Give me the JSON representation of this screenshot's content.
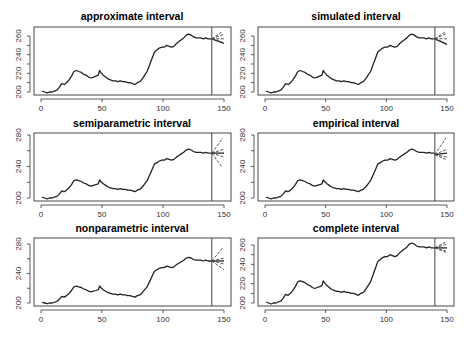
{
  "figure": {
    "layout": "3 rows x 2 columns",
    "line_color": "#222222",
    "forecast_color": "#555555",
    "cutoff_line_color": "#444444"
  },
  "chart_data": [
    {
      "type": "line",
      "title": "approximate interval",
      "xlabel": "",
      "ylabel": "",
      "xlim": [
        0,
        150
      ],
      "ylim": [
        196,
        268
      ],
      "xticks": [
        0,
        50,
        100,
        150
      ],
      "yticks": [
        200,
        210,
        220,
        230,
        240,
        250,
        260
      ],
      "ytick_labels": [
        "200",
        "",
        "220",
        "",
        "240",
        "",
        "260"
      ],
      "cutoff_x": 140,
      "grid": false,
      "forecast": {
        "start": [
          140,
          257
        ],
        "ends": [
          [
            150,
            262
          ],
          [
            150,
            257
          ],
          [
            150,
            252
          ],
          [
            149,
            265
          ],
          [
            148,
            254
          ]
        ]
      }
    },
    {
      "type": "line",
      "title": "simulated interval",
      "xlabel": "",
      "ylabel": "",
      "xlim": [
        0,
        150
      ],
      "ylim": [
        196,
        268
      ],
      "xticks": [
        0,
        50,
        100,
        150
      ],
      "yticks": [
        200,
        210,
        220,
        230,
        240,
        250,
        260
      ],
      "ytick_labels": [
        "200",
        "",
        "220",
        "",
        "240",
        "",
        "260"
      ],
      "cutoff_x": 140,
      "grid": false,
      "forecast": {
        "start": [
          140,
          257
        ],
        "ends": [
          [
            150,
            263
          ],
          [
            150,
            257
          ],
          [
            150,
            251
          ],
          [
            149,
            265
          ],
          [
            148,
            253
          ]
        ]
      }
    },
    {
      "type": "line",
      "title": "semiparametric interval",
      "xlabel": "",
      "ylabel": "",
      "xlim": [
        0,
        150
      ],
      "ylim": [
        196,
        284
      ],
      "xticks": [
        0,
        50,
        100,
        150
      ],
      "yticks": [
        200,
        220,
        240,
        260,
        280
      ],
      "ytick_labels": [
        "200",
        "",
        "240",
        "",
        "280"
      ],
      "cutoff_x": 140,
      "grid": false,
      "forecast": {
        "start": [
          140,
          257
        ],
        "ends": [
          [
            149,
            276
          ],
          [
            150,
            262
          ],
          [
            150,
            257
          ],
          [
            150,
            252
          ],
          [
            148,
            240
          ]
        ]
      }
    },
    {
      "type": "line",
      "title": "empirical interval",
      "xlabel": "",
      "ylabel": "",
      "xlim": [
        0,
        150
      ],
      "ylim": [
        196,
        284
      ],
      "xticks": [
        0,
        50,
        100,
        150
      ],
      "yticks": [
        200,
        220,
        240,
        260,
        280
      ],
      "ytick_labels": [
        "200",
        "",
        "240",
        "",
        "280"
      ],
      "cutoff_x": 140,
      "grid": false,
      "forecast": {
        "start": [
          140,
          255
        ],
        "ends": [
          [
            149,
            276
          ],
          [
            150,
            262
          ],
          [
            150,
            257
          ],
          [
            150,
            252
          ],
          [
            149,
            249
          ]
        ]
      }
    },
    {
      "type": "line",
      "title": "nonparametric interval",
      "xlabel": "",
      "ylabel": "",
      "xlim": [
        0,
        150
      ],
      "ylim": [
        196,
        284
      ],
      "xticks": [
        0,
        50,
        100,
        150
      ],
      "yticks": [
        200,
        220,
        240,
        260,
        280
      ],
      "ytick_labels": [
        "200",
        "",
        "240",
        "",
        "280"
      ],
      "cutoff_x": 140,
      "grid": false,
      "forecast": {
        "start": [
          140,
          257
        ],
        "ends": [
          [
            149,
            275
          ],
          [
            150,
            261
          ],
          [
            150,
            257
          ],
          [
            150,
            253
          ],
          [
            150,
            245
          ]
        ]
      }
    },
    {
      "type": "line",
      "title": "complete interval",
      "xlabel": "",
      "ylabel": "",
      "xlim": [
        0,
        150
      ],
      "ylim": [
        196,
        268
      ],
      "xticks": [
        0,
        50,
        100,
        150
      ],
      "yticks": [
        200,
        210,
        220,
        230,
        240,
        250,
        260
      ],
      "ytick_labels": [
        "200",
        "",
        "220",
        "",
        "240",
        "",
        "260"
      ],
      "cutoff_x": 140,
      "grid": false,
      "forecast": {
        "start": [
          140,
          257
        ],
        "ends": [
          [
            150,
            264
          ],
          [
            150,
            261
          ],
          [
            150,
            257
          ],
          [
            150,
            252
          ],
          [
            149,
            254
          ]
        ]
      }
    }
  ],
  "series": {
    "name": "observed",
    "x": [
      1,
      3,
      5,
      7,
      9,
      11,
      13,
      15,
      17,
      19,
      21,
      23,
      25,
      27,
      29,
      31,
      33,
      35,
      37,
      39,
      41,
      43,
      45,
      47,
      48,
      49,
      51,
      53,
      55,
      57,
      59,
      61,
      63,
      65,
      67,
      69,
      71,
      73,
      75,
      77,
      79,
      81,
      83,
      85,
      87,
      89,
      91,
      93,
      95,
      97,
      99,
      101,
      103,
      105,
      107,
      109,
      111,
      113,
      115,
      117,
      119,
      121,
      123,
      125,
      127,
      129,
      131,
      133,
      135,
      137,
      139,
      140
    ],
    "y": [
      201,
      200,
      199,
      200,
      200,
      201,
      202,
      205,
      209,
      208,
      210,
      213,
      217,
      222,
      223,
      222,
      221,
      219,
      218,
      216,
      215,
      216,
      217,
      218,
      223,
      221,
      218,
      216,
      214,
      213,
      212,
      212,
      211,
      212,
      211,
      211,
      210,
      210,
      209,
      208,
      210,
      211,
      214,
      218,
      222,
      229,
      236,
      243,
      245,
      247,
      248,
      248,
      250,
      249,
      248,
      249,
      252,
      254,
      256,
      258,
      261,
      262,
      261,
      259,
      258,
      258,
      258,
      257,
      258,
      257,
      257,
      257
    ]
  }
}
